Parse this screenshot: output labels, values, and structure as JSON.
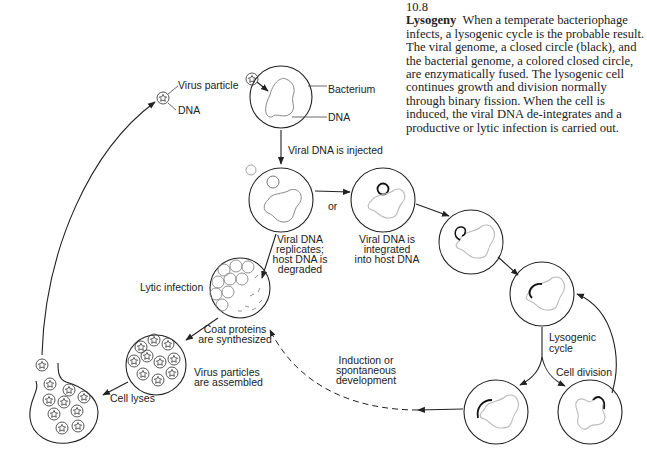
{
  "caption": {
    "figure_number": "10.8",
    "title": "Lysogeny",
    "text": "When a temperate bacteriophage infects, a lysogenic cycle is the probable result. The viral genome, a closed circle (black), and the bacterial genome, a colored closed circle, are enzymatically fused. The lysogenic cell continues growth and division normally through binary fission. When the cell is induced, the viral DNA de-integrates and a productive or lytic infection is carried out."
  },
  "labels": {
    "virus_particle": "Virus particle",
    "virus_dna": "DNA",
    "bacterium": "Bacterium",
    "bacterium_dna": "DNA",
    "injected": "Viral DNA is injected",
    "or": "or",
    "replicates": [
      "Viral DNA",
      "replicates;",
      "host DNA is",
      "degraded"
    ],
    "integrated": [
      "Viral DNA is",
      "integrated",
      "into host DNA"
    ],
    "lytic_infection": "Lytic infection",
    "coat_proteins": [
      "Coat proteins",
      "are synthesized"
    ],
    "virus_assembled": [
      "Virus particles",
      "are assembled"
    ],
    "cell_lyses": "Cell lyses",
    "induction": [
      "Induction or",
      "spontaneous",
      "development"
    ],
    "lysogenic_cycle": [
      "Lysogenic",
      "cycle"
    ],
    "cell_division": "Cell division"
  },
  "colors": {
    "line": "#222222",
    "host_dna": "#aaaaaa",
    "viral_dna": "#111111",
    "background": "#ffffff"
  }
}
